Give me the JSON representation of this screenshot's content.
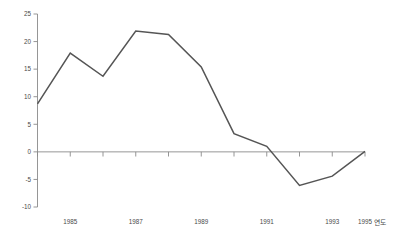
{
  "chart_data": {
    "type": "line",
    "title": "",
    "xlabel": "연도",
    "ylabel": "",
    "x": [
      1985,
      1986,
      1987,
      1988,
      1989,
      1990,
      1991,
      1992,
      1993,
      1994,
      1995
    ],
    "values": [
      8.7,
      17.9,
      13.7,
      21.9,
      21.3,
      15.4,
      3.3,
      1.0,
      -6.1,
      -4.4,
      0.1
    ],
    "series": [
      {
        "name": "",
        "values": [
          8.7,
          17.9,
          13.7,
          21.9,
          21.3,
          15.4,
          3.3,
          1.0,
          -6.1,
          -4.4,
          0.1
        ]
      }
    ],
    "categories": [
      "1985",
      "1986",
      "1987",
      "1988",
      "1989",
      "1990",
      "1991",
      "1992",
      "1993",
      "1994",
      "1995"
    ],
    "ylim": [
      -10,
      25
    ],
    "xlim": [
      1985,
      1995
    ],
    "ytick_labels": [
      "25",
      "20",
      "15",
      "10",
      "5",
      "0",
      "-5",
      "-10"
    ],
    "ytick_values": [
      25,
      20,
      15,
      10,
      5,
      0,
      -5,
      -10
    ],
    "xtick_labels": [
      "1985",
      "1987",
      "1989",
      "1991",
      "1993",
      "1995"
    ],
    "xtick_values": [
      1985,
      1987,
      1989,
      1991,
      1993,
      1995
    ],
    "grid": false,
    "legend": false,
    "legend_position": "none",
    "zero_line": 0,
    "colors": {
      "line": "#555555",
      "axis": "#8a8a8a",
      "text": "#4a4a4a",
      "background": "#ffffff"
    }
  },
  "axis": {
    "x_axis_name": "연도",
    "y_labels": [
      "25",
      "20",
      "15",
      "10",
      "5",
      "0",
      "-5",
      "-10"
    ],
    "x_labels": [
      "1985",
      "1987",
      "1989",
      "1991",
      "1993",
      "1995"
    ]
  },
  "clipped_header": {
    "text": ""
  }
}
